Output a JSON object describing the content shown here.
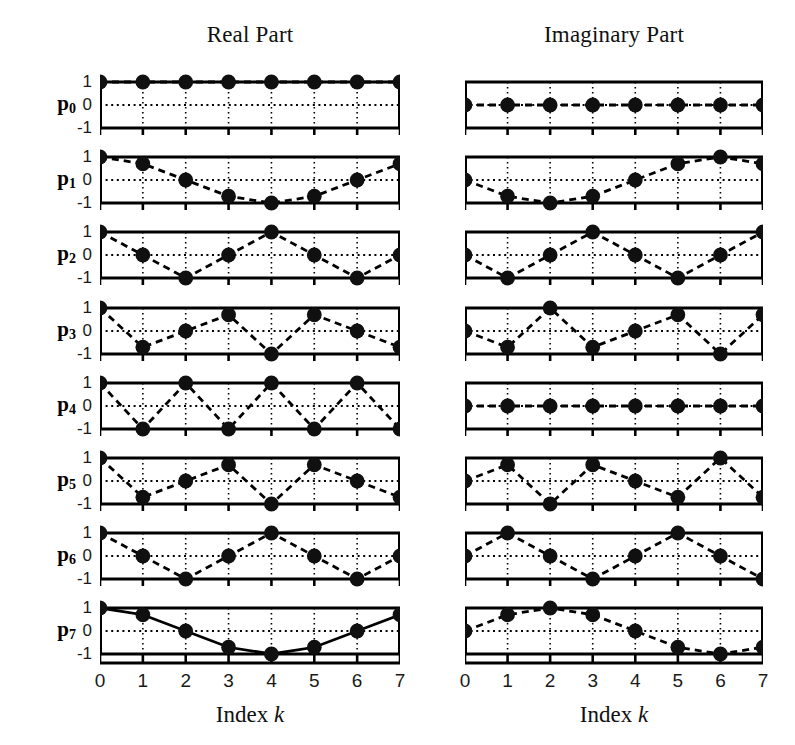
{
  "figure": {
    "columns": [
      {
        "id": "real",
        "title": "Real Part"
      },
      {
        "id": "imag",
        "title": "Imaginary Part"
      }
    ],
    "row_labels": [
      "p",
      "p",
      "p",
      "p",
      "p",
      "p",
      "p",
      "p"
    ],
    "row_subscripts": [
      "0",
      "1",
      "2",
      "3",
      "4",
      "5",
      "6",
      "7"
    ],
    "ytick_labels": [
      "1",
      "0",
      "-1"
    ],
    "xtick_labels": [
      "0",
      "1",
      "2",
      "3",
      "4",
      "5",
      "6",
      "7"
    ],
    "xaxis_title_text": "Index",
    "xaxis_title_var": "k",
    "colors": {
      "ink": "#000000",
      "background": "#ffffff",
      "marker": "#101010",
      "grid": "#101010"
    }
  },
  "chart_data": {
    "type": "line",
    "xlabel": "Index k",
    "ylabel": "",
    "x": [
      0,
      1,
      2,
      3,
      4,
      5,
      6,
      7
    ],
    "xlim": [
      0,
      7
    ],
    "ylim": [
      -1,
      1
    ],
    "yticks": [
      1,
      0,
      -1
    ],
    "grid": true,
    "legend": null,
    "panels": [
      {
        "row": 0,
        "column": "real",
        "label": "p0",
        "linestyle": "dashed",
        "values": [
          1,
          1,
          1,
          1,
          1,
          1,
          1,
          1
        ]
      },
      {
        "row": 0,
        "column": "imag",
        "label": "p0",
        "linestyle": "dashed",
        "values": [
          0,
          0,
          0,
          0,
          0,
          0,
          0,
          0
        ]
      },
      {
        "row": 1,
        "column": "real",
        "label": "p1",
        "linestyle": "dashed",
        "values": [
          1,
          0.707,
          0,
          -0.707,
          -1,
          -0.707,
          0,
          0.707
        ]
      },
      {
        "row": 1,
        "column": "imag",
        "label": "p1",
        "linestyle": "dashed",
        "values": [
          0,
          -0.707,
          -1,
          -0.707,
          0,
          0.707,
          1,
          0.707
        ]
      },
      {
        "row": 2,
        "column": "real",
        "label": "p2",
        "linestyle": "dashed",
        "values": [
          1,
          0,
          -1,
          0,
          1,
          0,
          -1,
          0
        ]
      },
      {
        "row": 2,
        "column": "imag",
        "label": "p2",
        "linestyle": "dashed",
        "values": [
          0,
          -1,
          0,
          1,
          0,
          -1,
          0,
          1
        ]
      },
      {
        "row": 3,
        "column": "real",
        "label": "p3",
        "linestyle": "dashed",
        "values": [
          1,
          -0.707,
          0,
          0.707,
          -1,
          0.707,
          0,
          -0.707
        ]
      },
      {
        "row": 3,
        "column": "imag",
        "label": "p3",
        "linestyle": "dashed",
        "values": [
          0,
          -0.707,
          1,
          -0.707,
          0,
          0.707,
          -1,
          0.707
        ]
      },
      {
        "row": 4,
        "column": "real",
        "label": "p4",
        "linestyle": "dashed",
        "values": [
          1,
          -1,
          1,
          -1,
          1,
          -1,
          1,
          -1
        ]
      },
      {
        "row": 4,
        "column": "imag",
        "label": "p4",
        "linestyle": "dashed",
        "values": [
          0,
          0,
          0,
          0,
          0,
          0,
          0,
          0
        ]
      },
      {
        "row": 5,
        "column": "real",
        "label": "p5",
        "linestyle": "dashed",
        "values": [
          1,
          -0.707,
          0,
          0.707,
          -1,
          0.707,
          0,
          -0.707
        ]
      },
      {
        "row": 5,
        "column": "imag",
        "label": "p5",
        "linestyle": "dashed",
        "values": [
          0,
          0.707,
          -1,
          0.707,
          0,
          -0.707,
          1,
          -0.707
        ]
      },
      {
        "row": 6,
        "column": "real",
        "label": "p6",
        "linestyle": "dashed",
        "values": [
          1,
          0,
          -1,
          0,
          1,
          0,
          -1,
          0
        ]
      },
      {
        "row": 6,
        "column": "imag",
        "label": "p6",
        "linestyle": "dashed",
        "values": [
          0,
          1,
          0,
          -1,
          0,
          1,
          0,
          -1
        ]
      },
      {
        "row": 7,
        "column": "real",
        "label": "p7",
        "linestyle": "solid",
        "values": [
          1,
          0.707,
          0,
          -0.707,
          -1,
          -0.707,
          0,
          0.707
        ]
      },
      {
        "row": 7,
        "column": "imag",
        "label": "p7",
        "linestyle": "dashed",
        "values": [
          0,
          0.707,
          1,
          0.707,
          0,
          -0.707,
          -1,
          -0.707
        ]
      }
    ]
  }
}
